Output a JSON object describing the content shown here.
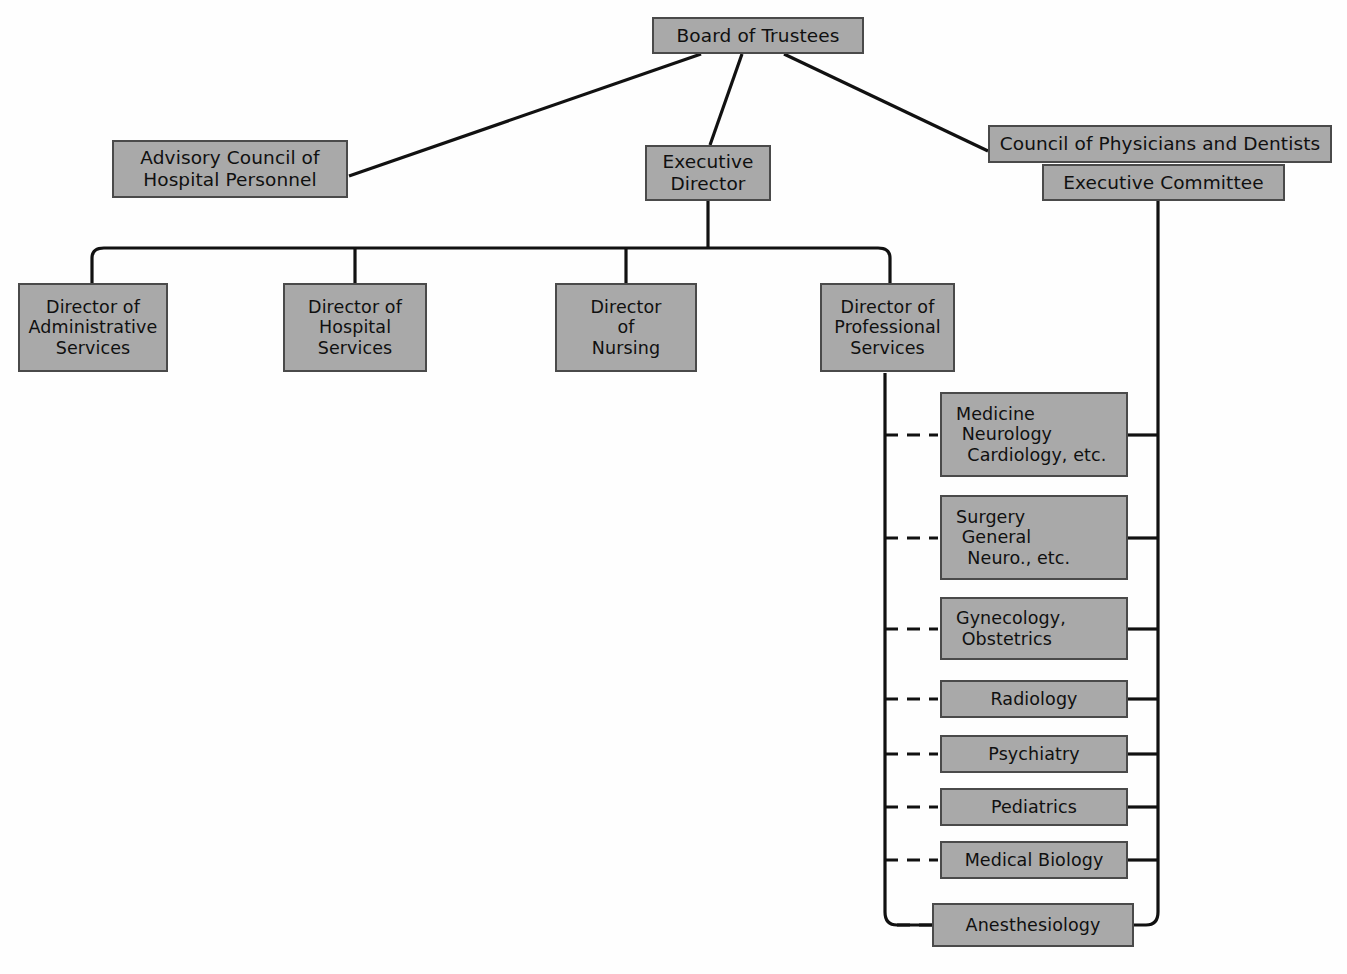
{
  "diagram": {
    "style": {
      "box_fill": "#a9a9a9",
      "box_border": "#4a4a4a",
      "line_color": "#111111",
      "background": "#fefefe",
      "dashed_connector": "dashed",
      "solid_connector": "solid"
    },
    "nodes": {
      "board": {
        "label": "Board of Trustees"
      },
      "advisory": {
        "line1": "Advisory Council of",
        "line2": "Hospital Personnel"
      },
      "exec_director": {
        "line1": "Executive",
        "line2": "Director"
      },
      "council": {
        "label": "Council of Physicians and Dentists"
      },
      "exec_committee": {
        "label": "Executive Committee"
      },
      "dir_admin": {
        "line1": "Director of",
        "line2": "Administrative",
        "line3": "Services"
      },
      "dir_hospital": {
        "line1": "Director of",
        "line2": "Hospital",
        "line3": "Services"
      },
      "dir_nursing": {
        "line1": "Director",
        "line2": "of",
        "line3": "Nursing"
      },
      "dir_professional": {
        "line1": "Director of",
        "line2": "Professional",
        "line3": "Services"
      }
    },
    "departments": [
      {
        "name": "medicine",
        "lines": [
          "Medicine",
          " Neurology",
          "  Cardiology, etc."
        ],
        "align": "left"
      },
      {
        "name": "surgery",
        "lines": [
          "Surgery",
          " General",
          "  Neuro., etc."
        ],
        "align": "left"
      },
      {
        "name": "gynecology",
        "lines": [
          "Gynecology,",
          " Obstetrics"
        ],
        "align": "left"
      },
      {
        "name": "radiology",
        "lines": [
          "Radiology"
        ],
        "align": "center"
      },
      {
        "name": "psychiatry",
        "lines": [
          "Psychiatry"
        ],
        "align": "center"
      },
      {
        "name": "pediatrics",
        "lines": [
          "Pediatrics"
        ],
        "align": "center"
      },
      {
        "name": "medical-biology",
        "lines": [
          "Medical Biology"
        ],
        "align": "center"
      },
      {
        "name": "anesthesiology",
        "lines": [
          "Anesthesiology"
        ],
        "align": "center"
      }
    ],
    "department_labels": {
      "medicine": "Medicine\n Neurology\n  Cardiology, etc.",
      "surgery": "Surgery\n General\n  Neuro., etc.",
      "gynecology": "Gynecology,\n Obstetrics",
      "radiology": "Radiology",
      "psychiatry": "Psychiatry",
      "pediatrics": "Pediatrics",
      "medical_biology": "Medical Biology",
      "anesthesiology": "Anesthesiology"
    }
  }
}
